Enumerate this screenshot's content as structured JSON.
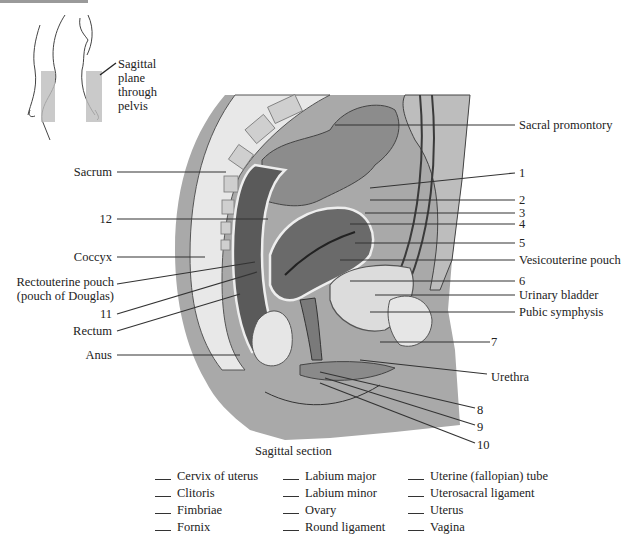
{
  "inset": {
    "label_lines": [
      "Sagittal",
      "plane",
      "through",
      "pelvis"
    ]
  },
  "labels_left": {
    "sacrum": "Sacrum",
    "n12": "12",
    "coccyx": "Coccyx",
    "rectouterine_1": "Rectouterine pouch",
    "rectouterine_2": "(pouch of Douglas)",
    "n11": "11",
    "rectum": "Rectum",
    "anus": "Anus"
  },
  "labels_right": {
    "sacral_promontory": "Sacral promontory",
    "n1": "1",
    "n2": "2",
    "n3": "3",
    "n4": "4",
    "n5": "5",
    "vesicouterine": "Vesicouterine pouch",
    "n6": "6",
    "urinary_bladder": "Urinary bladder",
    "pubic_symphysis": "Pubic symphysis",
    "n7": "7",
    "urethra": "Urethra",
    "n8": "8",
    "n9": "9",
    "n10": "10"
  },
  "caption": "Sagittal section",
  "answer_key": {
    "columns": [
      [
        "Cervix of uterus",
        "Clitoris",
        "Fimbriae",
        "Fornix"
      ],
      [
        "Labium major",
        "Labium minor",
        "Ovary",
        "Round ligament"
      ],
      [
        "Uterine (fallopian) tube",
        "Uterosacral ligament",
        "Uterus",
        "Vagina"
      ]
    ]
  },
  "colors": {
    "skin": "#a9a9a9",
    "bone": "#e6e6e6",
    "rectum": "#5a5a5a",
    "tissue": "#8f8f8f",
    "line": "#333333"
  }
}
